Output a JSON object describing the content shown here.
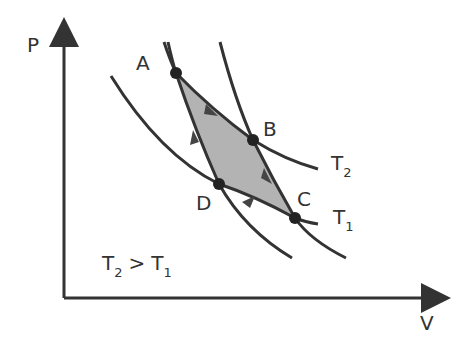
{
  "axes": {
    "y_label": "P",
    "x_label": "V"
  },
  "points": [
    {
      "name": "A",
      "x": 176,
      "y": 73
    },
    {
      "name": "B",
      "x": 253,
      "y": 140
    },
    {
      "name": "C",
      "x": 295,
      "y": 218
    },
    {
      "name": "D",
      "x": 219,
      "y": 184
    }
  ],
  "isotherms": [
    {
      "name": "T",
      "sub": "2"
    },
    {
      "name": "T",
      "sub": "1"
    }
  ],
  "condition": {
    "left": "T",
    "left_sub": "2",
    "op": ">",
    "right": "T",
    "right_sub": "1"
  },
  "colors": {
    "line": "#333333",
    "fill": "#b3b3b3"
  }
}
